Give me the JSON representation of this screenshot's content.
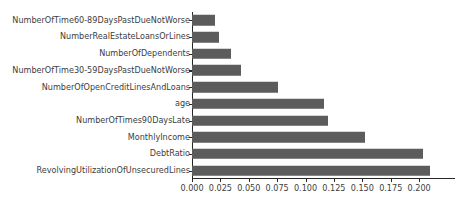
{
  "chart_data": {
    "type": "bar",
    "orientation": "horizontal",
    "title": "",
    "xlabel": "",
    "ylabel": "",
    "grid": false,
    "legend": null,
    "xlim": [
      0.0,
      0.2316
    ],
    "xticks": [
      0.0,
      0.025,
      0.05,
      0.075,
      0.1,
      0.125,
      0.15,
      0.175,
      0.2
    ],
    "xtick_labels": [
      "0.000",
      "0.025",
      "0.050",
      "0.075",
      "0.100",
      "0.125",
      "0.150",
      "0.175",
      "0.200"
    ],
    "categories": [
      "NumberOfTime60-89DaysPastDueNotWorse",
      "NumberRealEstateLoansOrLines",
      "NumberOfDependents",
      "NumberOfTime30-59DaysPastDueNotWorse",
      "NumberOfOpenCreditLinesAndLoans",
      "age",
      "NumberOfTimes90DaysLate",
      "MonthlyIncome",
      "DebtRatio",
      "RevolvingUtilizationOfUnsecuredLines"
    ],
    "values": [
      0.02,
      0.024,
      0.034,
      0.043,
      0.076,
      0.116,
      0.12,
      0.152,
      0.203,
      0.21
    ],
    "bar_color": "#5c5c5c",
    "axis_color": "#262626",
    "text_color": "#3d3d3d"
  }
}
